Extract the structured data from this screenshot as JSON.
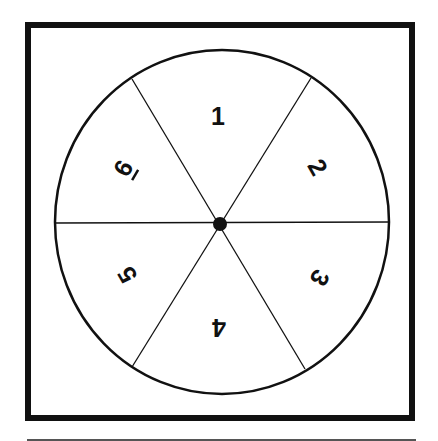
{
  "diagram": {
    "type": "spinner",
    "segment_count": 6,
    "frame": {
      "x": 25,
      "y": 22,
      "width": 390,
      "height": 399,
      "stroke_width": 6,
      "color": "#111111"
    },
    "circle": {
      "cx": 222,
      "cy": 222,
      "rx": 167,
      "ry": 172,
      "stroke_width": 2.5,
      "color": "#111111"
    },
    "hub": {
      "cx": 220,
      "cy": 224,
      "r": 7,
      "color": "#111111"
    },
    "spokes": [
      {
        "x1": 132,
        "y1": 79,
        "x2": 305,
        "y2": 369
      },
      {
        "x1": 311,
        "y1": 78,
        "x2": 132,
        "y2": 367
      },
      {
        "x1": 55,
        "y1": 223,
        "x2": 389,
        "y2": 222
      }
    ],
    "segments": [
      {
        "label": "1",
        "x": 218,
        "y": 116,
        "rotation": 0
      },
      {
        "label": "2",
        "x": 318,
        "y": 167,
        "rotation": 60
      },
      {
        "label": "3",
        "x": 320,
        "y": 278,
        "rotation": 120
      },
      {
        "label": "4",
        "x": 219,
        "y": 328,
        "rotation": 180
      },
      {
        "label": "5",
        "x": 127,
        "y": 275,
        "rotation": 240
      },
      {
        "label": "6",
        "x": 123,
        "y": 168,
        "rotation": 300,
        "underlined": true
      }
    ],
    "footer_rule": {
      "x1": 27,
      "y1": 440,
      "x2": 416,
      "y2": 440,
      "color": "#555555"
    }
  }
}
